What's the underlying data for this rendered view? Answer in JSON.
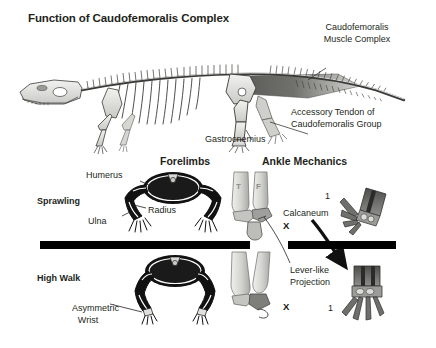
{
  "figure": {
    "title": "Function of Caudofemoralis Complex",
    "width": 436,
    "height": 348,
    "background": "#ffffff",
    "ink_color": "#231f20"
  },
  "skeleton_panel": {
    "subject": "crocodilian-skeleton-lateral-view",
    "labels": [
      {
        "id": "caudofemoralis",
        "line1": "Caudofemoralis",
        "line2": "Muscle Complex"
      },
      {
        "id": "accessory-tendon",
        "line1": "Accessory Tendon of",
        "line2": "Caudofemoralis Group"
      },
      {
        "id": "gastrocnemius",
        "line1": "Gastrocnemius"
      }
    ]
  },
  "comparison": {
    "columns": [
      {
        "id": "forelimbs",
        "heading": "Forelimbs"
      },
      {
        "id": "ankle-mechanics",
        "heading": "Ankle Mechanics"
      }
    ],
    "rows": [
      {
        "id": "sprawling",
        "label": "Sprawling"
      },
      {
        "id": "high-walk",
        "label": "High Walk"
      }
    ]
  },
  "forelimb_labels": {
    "humerus": "Humerus",
    "radius": "Radius",
    "ulna": "Ulna",
    "asymmetric_line1": "Asymmetric",
    "asymmetric_line2": "Wrist"
  },
  "ankle_labels": {
    "tibia_abbrev": "T",
    "fibula_abbrev": "F",
    "calcaneum": "Calcaneum",
    "lever_line1": "Lever-like",
    "lever_line2": "Projection",
    "x_marker": "X",
    "digit_one": "1"
  },
  "colors": {
    "bone_light": "#e8e8e6",
    "bone_mid": "#b9b9b6",
    "bone_dark": "#7d7d7a",
    "outline": "#3a3a38",
    "silhouette": "#111111",
    "muscle_dark": "#4a4a48",
    "bar": "#000000"
  }
}
